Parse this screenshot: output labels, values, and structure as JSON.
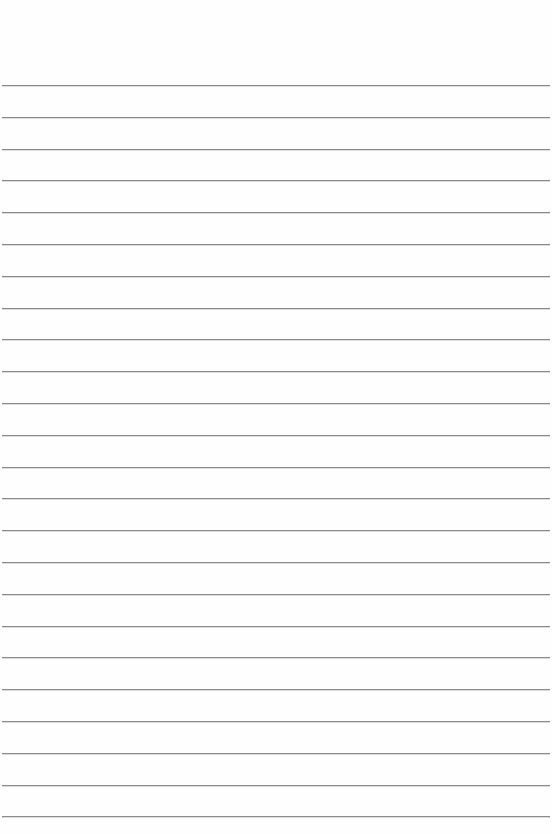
{
  "paper": {
    "type": "lined-paper",
    "line_count": 24,
    "first_line_y": 85,
    "line_spacing": 31.8,
    "line_color": "#8a8a8a",
    "background_color": "#fefefe"
  }
}
